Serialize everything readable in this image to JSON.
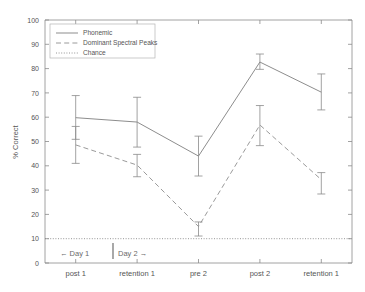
{
  "chart_data": {
    "type": "line",
    "title": "",
    "xlabel": "",
    "ylabel": "% Correct",
    "ylim": [
      0,
      100
    ],
    "yticks": [
      0,
      10,
      20,
      30,
      40,
      50,
      60,
      70,
      80,
      90,
      100
    ],
    "grid": false,
    "legend_position": "top-left",
    "categories": [
      "post 1",
      "retention 1",
      "pre 2",
      "post 2",
      "retention 1"
    ],
    "series": [
      {
        "name": "Phonemic",
        "style": "solid",
        "values": [
          59.8,
          58.0,
          44.0,
          82.7,
          70.3
        ],
        "error_low": [
          50.9,
          47.7,
          35.8,
          79.7,
          63.0
        ],
        "error_high": [
          68.9,
          68.2,
          52.2,
          86.0,
          77.8
        ]
      },
      {
        "name": "Dominant Spectral Peaks",
        "style": "dashed",
        "values": [
          48.6,
          40.3,
          15.0,
          56.8,
          34.3
        ],
        "error_low": [
          41.0,
          35.5,
          11.1,
          48.3,
          28.4
        ],
        "error_high": [
          56.2,
          44.7,
          16.9,
          64.8,
          37.2
        ]
      },
      {
        "name": "Chance",
        "style": "dotted",
        "values": [
          10,
          10,
          10,
          10,
          10
        ],
        "error_low": [
          10,
          10,
          10,
          10,
          10
        ],
        "error_high": [
          10,
          10,
          10,
          10,
          10
        ]
      }
    ],
    "annotations": [
      {
        "name": "day-1-label",
        "text": "← Day 1"
      },
      {
        "name": "day-2-label",
        "text": "Day 2 →"
      }
    ],
    "colors": {
      "axis": "#8a8a8a",
      "solid_series": "#8d8d8d",
      "dashed_series": "#9a9a9a",
      "dotted_series": "#8a8a8a",
      "background": "#ffffff",
      "text": "#555555"
    }
  },
  "legend": {
    "entries": [
      {
        "label": "Phonemic"
      },
      {
        "label": "Dominant Spectral Peaks"
      },
      {
        "label": "Chance"
      }
    ]
  },
  "axis": {
    "y_title": "% Correct",
    "y_tick_labels": [
      "0",
      "10",
      "20",
      "30",
      "40",
      "50",
      "60",
      "70",
      "80",
      "90",
      "100"
    ],
    "x_tick_labels": [
      "post 1",
      "retention 1",
      "pre 2",
      "post 2",
      "retention 1"
    ]
  },
  "day_divider": {
    "left_label": "← Day 1",
    "right_label": "Day 2 →"
  }
}
